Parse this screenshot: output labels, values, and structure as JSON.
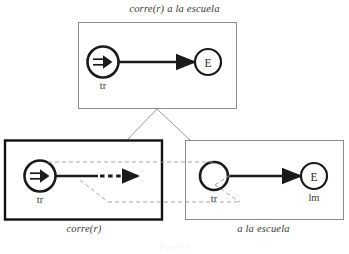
{
  "figure": {
    "caption": "Figura 3",
    "top_box": {
      "title": "corre(r) a la escuela",
      "nodes": [
        {
          "id": "tr-node-top",
          "label": "tr",
          "inner_glyph": "double-arrow",
          "inner_text": ""
        },
        {
          "id": "e-node-top",
          "label": "",
          "inner_glyph": "",
          "inner_text": "E"
        }
      ],
      "edge": {
        "type": "solid-arrow",
        "from": "tr-node-top",
        "to": "e-node-top"
      }
    },
    "bottom_left_box": {
      "title": "corre(r)",
      "border": "thick",
      "nodes": [
        {
          "id": "tr-node-left",
          "label": "tr",
          "inner_glyph": "double-arrow",
          "inner_text": ""
        }
      ],
      "edge": {
        "type": "solid-then-dotted-arrow",
        "from": "tr-node-left",
        "to": "open-end"
      }
    },
    "bottom_right_box": {
      "title": "a la escuela",
      "border": "thin",
      "nodes": [
        {
          "id": "tr-node-right",
          "label": "tr",
          "inner_glyph": "",
          "inner_text": ""
        },
        {
          "id": "e-node-right",
          "label": "lm",
          "inner_glyph": "",
          "inner_text": "E"
        }
      ],
      "edge": {
        "type": "solid-arrow",
        "from": "tr-node-right",
        "to": "e-node-right"
      }
    },
    "connectors": {
      "inheritance": [
        {
          "name": "top-to-bottom-left",
          "style": "solid-thin-gray"
        },
        {
          "name": "top-to-bottom-right",
          "style": "solid-thin-gray"
        }
      ],
      "correspondence": [
        {
          "name": "upper-correspondence-line",
          "style": "dashed-gray"
        },
        {
          "name": "lower-correspondence-line",
          "style": "dashed-gray"
        },
        {
          "name": "left-diagonal-correspondence",
          "style": "dashed-gray"
        },
        {
          "name": "right-diagonal-correspondence",
          "style": "dashed-gray"
        }
      ]
    },
    "colors": {
      "ink": "#1a1a1a",
      "thin_border": "#8c8c8c",
      "dashed": "#9a9a9a",
      "text": "#3a3a3a",
      "background": "#ffffff"
    }
  }
}
